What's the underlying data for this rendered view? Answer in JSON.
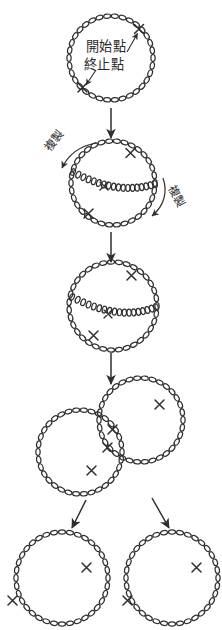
{
  "figure": {
    "title": "",
    "background_color": "#ffffff",
    "ink_color": "#2f2f2f",
    "labels": {
      "start_point": "開始點",
      "end_point": "終止點",
      "replication_left": "複製",
      "replication_right": "複製"
    },
    "stages": [
      {
        "id": "stage-1",
        "name": "parental-circular-dna",
        "description": "開始點 / 終止點",
        "circles": 1,
        "cross_marks": 2
      },
      {
        "id": "stage-2",
        "name": "theta-replication-early",
        "description": "複製",
        "circles": 1,
        "cross_marks": 3
      },
      {
        "id": "stage-3",
        "name": "theta-replication-late",
        "description": "",
        "circles": 1,
        "cross_marks": 3
      },
      {
        "id": "stage-4",
        "name": "catenated-daughter-circles",
        "description": "",
        "circles": 2,
        "cross_marks": 4
      },
      {
        "id": "stage-5",
        "name": "separated-daughter-circles",
        "description": "",
        "circles": 2,
        "cross_marks": 4
      }
    ],
    "arrows": [
      {
        "id": "arrow-1",
        "name": "arrow-stage1-to-stage2",
        "direction": "down"
      },
      {
        "id": "arrow-2",
        "name": "arrow-stage2-to-stage3",
        "direction": "down"
      },
      {
        "id": "arrow-3",
        "name": "arrow-stage3-to-stage4",
        "direction": "down"
      },
      {
        "id": "arrow-4",
        "name": "arrow-stage4-to-left-circle",
        "direction": "down-left"
      },
      {
        "id": "arrow-5",
        "name": "arrow-stage4-to-right-circle",
        "direction": "down-right"
      },
      {
        "id": "arrow-6",
        "name": "pointer-start-point",
        "direction": "up-right"
      },
      {
        "id": "arrow-7",
        "name": "pointer-end-point",
        "direction": "down-left"
      },
      {
        "id": "arrow-8",
        "name": "curved-arrow-replication-left",
        "direction": "curve-left"
      },
      {
        "id": "arrow-9",
        "name": "curved-arrow-replication-right",
        "direction": "curve-right"
      }
    ]
  }
}
